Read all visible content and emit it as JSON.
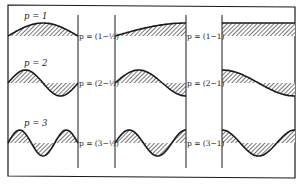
{
  "figure": {
    "colors": {
      "line": "#1a1a1a",
      "hatch": "#555555",
      "background": "#ffffff"
    },
    "columns": [
      {
        "id": "col1",
        "x0": 8,
        "x1": 78
      },
      {
        "id": "col2",
        "x0": 115,
        "x1": 186
      },
      {
        "id": "col3",
        "x0": 222,
        "x1": 295
      }
    ],
    "rows": [
      {
        "mode": 1,
        "baseline": 36,
        "amplitude": 13,
        "top_label": "p = 1",
        "mid_label": "p = (1−½)",
        "right_label": "p = (1−1)"
      },
      {
        "mode": 2,
        "baseline": 83,
        "amplitude": 13,
        "top_label": "p = 2",
        "mid_label": "p = (2−½)",
        "right_label": "p = (2−1)"
      },
      {
        "mode": 3,
        "baseline": 143,
        "amplitude": 13,
        "top_label": "p = 3",
        "mid_label": "p = (3−½)",
        "right_label": "p = (3−1)"
      }
    ]
  }
}
